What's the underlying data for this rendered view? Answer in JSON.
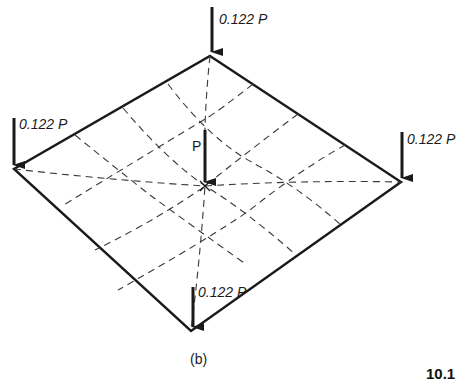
{
  "figure": {
    "caption": "(b)",
    "figure_number_partial": "10.1",
    "center_load_label": "P",
    "corner_loads": {
      "top": "0.122 P",
      "left": "0.122 P",
      "right": "0.122 P",
      "bottom": "0.122 P"
    }
  },
  "colors": {
    "line": "#1a1a1a",
    "dashed": "#3a3a3a",
    "background": "#ffffff"
  }
}
